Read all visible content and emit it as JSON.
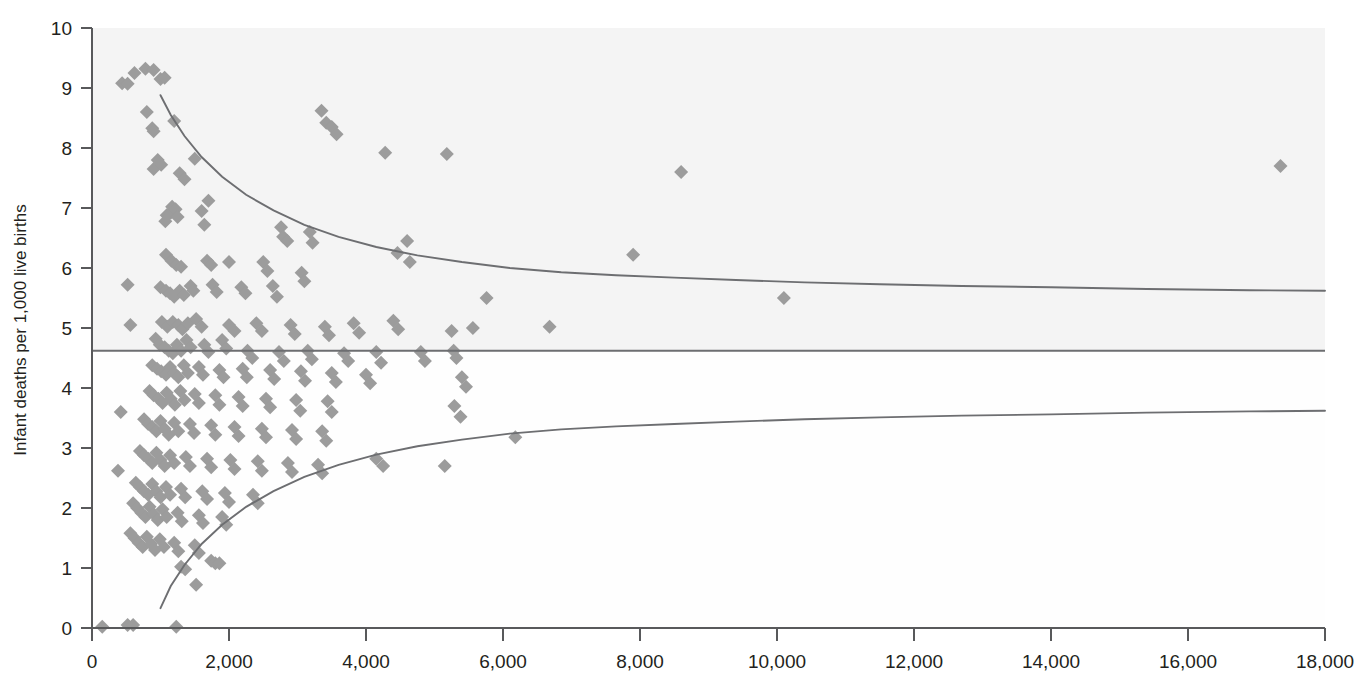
{
  "chart_data": {
    "type": "scatter",
    "title": "",
    "subtitle": "",
    "xlabel": "",
    "ylabel": "Infant deaths per 1,000 live births",
    "xlim": [
      0,
      18000
    ],
    "ylim": [
      0,
      10
    ],
    "grid": false,
    "legend": "none",
    "x_ticks": [
      0,
      2000,
      4000,
      6000,
      8000,
      10000,
      12000,
      14000,
      16000,
      18000
    ],
    "x_tick_labels": [
      "0",
      "2,000",
      "4,000",
      "6,000",
      "8,000",
      "10,000",
      "12,000",
      "14,000",
      "16,000",
      "18,000"
    ],
    "y_ticks": [
      0,
      1,
      2,
      3,
      4,
      5,
      6,
      7,
      8,
      9,
      10
    ],
    "y_tick_labels": [
      "0",
      "1",
      "2",
      "3",
      "4",
      "5",
      "6",
      "7",
      "8",
      "9",
      "10"
    ],
    "marker_shape": "diamond",
    "marker_color": "#9c9c9c",
    "marker_size": 11,
    "line_color": "#6d6e71",
    "center_line": {
      "label": "overall mean",
      "value": 4.62,
      "x_from": 0,
      "x_to": 18000
    },
    "control_limits": {
      "label": "95% control limits",
      "x_from": 1000,
      "x_to": 18000,
      "upper": [
        [
          1000,
          8.88
        ],
        [
          1150,
          8.55
        ],
        [
          1350,
          8.2
        ],
        [
          1600,
          7.85
        ],
        [
          1900,
          7.52
        ],
        [
          2250,
          7.22
        ],
        [
          2650,
          6.96
        ],
        [
          3100,
          6.72
        ],
        [
          3600,
          6.52
        ],
        [
          4150,
          6.35
        ],
        [
          4750,
          6.21
        ],
        [
          5400,
          6.1
        ],
        [
          6100,
          6.0
        ],
        [
          6850,
          5.93
        ],
        [
          7650,
          5.88
        ],
        [
          8500,
          5.84
        ],
        [
          9400,
          5.8
        ],
        [
          10400,
          5.76
        ],
        [
          11500,
          5.73
        ],
        [
          12700,
          5.7
        ],
        [
          14000,
          5.68
        ],
        [
          15400,
          5.65
        ],
        [
          16900,
          5.63
        ],
        [
          18000,
          5.62
        ]
      ],
      "lower": [
        [
          1000,
          0.33
        ],
        [
          1150,
          0.7
        ],
        [
          1350,
          1.05
        ],
        [
          1600,
          1.4
        ],
        [
          1900,
          1.72
        ],
        [
          2250,
          2.02
        ],
        [
          2650,
          2.28
        ],
        [
          3100,
          2.52
        ],
        [
          3600,
          2.72
        ],
        [
          4150,
          2.89
        ],
        [
          4750,
          3.03
        ],
        [
          5400,
          3.14
        ],
        [
          6100,
          3.24
        ],
        [
          6850,
          3.31
        ],
        [
          7650,
          3.36
        ],
        [
          8500,
          3.4
        ],
        [
          9400,
          3.44
        ],
        [
          10400,
          3.48
        ],
        [
          11500,
          3.51
        ],
        [
          12700,
          3.54
        ],
        [
          14000,
          3.56
        ],
        [
          15400,
          3.59
        ],
        [
          16900,
          3.61
        ],
        [
          18000,
          3.62
        ]
      ]
    },
    "points": [
      [
        150,
        0.02
      ],
      [
        520,
        0.05
      ],
      [
        600,
        0.05
      ],
      [
        1230,
        0.02
      ],
      [
        440,
        9.08
      ],
      [
        520,
        9.07
      ],
      [
        620,
        9.25
      ],
      [
        780,
        9.32
      ],
      [
        900,
        9.3
      ],
      [
        1000,
        9.15
      ],
      [
        1060,
        9.17
      ],
      [
        1200,
        8.45
      ],
      [
        800,
        8.6
      ],
      [
        880,
        8.33
      ],
      [
        900,
        8.28
      ],
      [
        3350,
        8.62
      ],
      [
        3420,
        8.42
      ],
      [
        3500,
        8.35
      ],
      [
        3570,
        8.23
      ],
      [
        4280,
        7.92
      ],
      [
        5180,
        7.9
      ],
      [
        8600,
        7.6
      ],
      [
        17350,
        7.7
      ],
      [
        900,
        7.65
      ],
      [
        960,
        7.8
      ],
      [
        1010,
        7.72
      ],
      [
        1500,
        7.82
      ],
      [
        1280,
        7.58
      ],
      [
        1350,
        7.48
      ],
      [
        1700,
        7.12
      ],
      [
        1170,
        7.02
      ],
      [
        1220,
        6.98
      ],
      [
        1150,
        6.92
      ],
      [
        1090,
        6.88
      ],
      [
        1250,
        6.85
      ],
      [
        1070,
        6.78
      ],
      [
        1600,
        6.95
      ],
      [
        1640,
        6.72
      ],
      [
        2760,
        6.68
      ],
      [
        2790,
        6.52
      ],
      [
        2850,
        6.45
      ],
      [
        3180,
        6.6
      ],
      [
        3220,
        6.42
      ],
      [
        4600,
        6.45
      ],
      [
        4640,
        6.1
      ],
      [
        4460,
        6.25
      ],
      [
        7900,
        6.22
      ],
      [
        1080,
        6.22
      ],
      [
        1160,
        6.12
      ],
      [
        1230,
        6.05
      ],
      [
        1300,
        6.02
      ],
      [
        1680,
        6.12
      ],
      [
        1740,
        6.05
      ],
      [
        2000,
        6.1
      ],
      [
        2500,
        6.1
      ],
      [
        2560,
        5.95
      ],
      [
        3060,
        5.92
      ],
      [
        3100,
        5.78
      ],
      [
        520,
        5.72
      ],
      [
        1000,
        5.68
      ],
      [
        1080,
        5.62
      ],
      [
        1140,
        5.58
      ],
      [
        1200,
        5.52
      ],
      [
        1280,
        5.62
      ],
      [
        1340,
        5.55
      ],
      [
        1440,
        5.7
      ],
      [
        1480,
        5.62
      ],
      [
        1760,
        5.72
      ],
      [
        1820,
        5.6
      ],
      [
        2180,
        5.68
      ],
      [
        2240,
        5.58
      ],
      [
        2640,
        5.7
      ],
      [
        2700,
        5.52
      ],
      [
        5760,
        5.5
      ],
      [
        10100,
        5.5
      ],
      [
        560,
        5.05
      ],
      [
        1020,
        5.1
      ],
      [
        1100,
        5.02
      ],
      [
        1180,
        5.1
      ],
      [
        1260,
        5.05
      ],
      [
        1320,
        4.98
      ],
      [
        1400,
        5.08
      ],
      [
        1520,
        5.15
      ],
      [
        1600,
        5.02
      ],
      [
        2000,
        5.05
      ],
      [
        2080,
        4.95
      ],
      [
        2400,
        5.08
      ],
      [
        2480,
        4.95
      ],
      [
        2900,
        5.05
      ],
      [
        2960,
        4.9
      ],
      [
        3400,
        5.02
      ],
      [
        3460,
        4.88
      ],
      [
        3820,
        5.08
      ],
      [
        3900,
        4.92
      ],
      [
        4400,
        5.12
      ],
      [
        4470,
        4.98
      ],
      [
        5560,
        5.0
      ],
      [
        6680,
        5.02
      ],
      [
        5250,
        4.95
      ],
      [
        5280,
        4.62
      ],
      [
        5320,
        4.5
      ],
      [
        930,
        4.82
      ],
      [
        990,
        4.72
      ],
      [
        1060,
        4.68
      ],
      [
        1120,
        4.62
      ],
      [
        1180,
        4.58
      ],
      [
        1240,
        4.72
      ],
      [
        1300,
        4.62
      ],
      [
        1380,
        4.8
      ],
      [
        1440,
        4.68
      ],
      [
        1640,
        4.72
      ],
      [
        1700,
        4.6
      ],
      [
        1900,
        4.8
      ],
      [
        1960,
        4.66
      ],
      [
        2270,
        4.62
      ],
      [
        2340,
        4.5
      ],
      [
        2730,
        4.6
      ],
      [
        2800,
        4.45
      ],
      [
        3150,
        4.62
      ],
      [
        3210,
        4.48
      ],
      [
        3680,
        4.58
      ],
      [
        3740,
        4.45
      ],
      [
        4150,
        4.6
      ],
      [
        4220,
        4.42
      ],
      [
        4800,
        4.6
      ],
      [
        4860,
        4.45
      ],
      [
        880,
        4.38
      ],
      [
        950,
        4.32
      ],
      [
        1010,
        4.28
      ],
      [
        1080,
        4.22
      ],
      [
        1140,
        4.35
      ],
      [
        1200,
        4.25
      ],
      [
        1260,
        4.18
      ],
      [
        1340,
        4.38
      ],
      [
        1400,
        4.25
      ],
      [
        1560,
        4.35
      ],
      [
        1620,
        4.22
      ],
      [
        1860,
        4.3
      ],
      [
        1920,
        4.18
      ],
      [
        2200,
        4.32
      ],
      [
        2260,
        4.18
      ],
      [
        2600,
        4.3
      ],
      [
        2660,
        4.15
      ],
      [
        3050,
        4.28
      ],
      [
        3110,
        4.12
      ],
      [
        3500,
        4.25
      ],
      [
        3560,
        4.1
      ],
      [
        4000,
        4.22
      ],
      [
        4060,
        4.08
      ],
      [
        5400,
        4.18
      ],
      [
        5460,
        4.02
      ],
      [
        840,
        3.95
      ],
      [
        900,
        3.88
      ],
      [
        970,
        3.82
      ],
      [
        1030,
        3.75
      ],
      [
        1090,
        3.92
      ],
      [
        1150,
        3.82
      ],
      [
        1210,
        3.72
      ],
      [
        1290,
        3.95
      ],
      [
        1350,
        3.8
      ],
      [
        1500,
        3.9
      ],
      [
        1560,
        3.75
      ],
      [
        1800,
        3.88
      ],
      [
        1860,
        3.72
      ],
      [
        2140,
        3.85
      ],
      [
        2200,
        3.7
      ],
      [
        2540,
        3.82
      ],
      [
        2600,
        3.68
      ],
      [
        2980,
        3.8
      ],
      [
        3040,
        3.62
      ],
      [
        3440,
        3.78
      ],
      [
        3500,
        3.6
      ],
      [
        5290,
        3.7
      ],
      [
        5380,
        3.52
      ],
      [
        420,
        3.6
      ],
      [
        760,
        3.48
      ],
      [
        820,
        3.4
      ],
      [
        880,
        3.35
      ],
      [
        940,
        3.28
      ],
      [
        1000,
        3.45
      ],
      [
        1060,
        3.32
      ],
      [
        1120,
        3.22
      ],
      [
        1200,
        3.42
      ],
      [
        1260,
        3.28
      ],
      [
        1430,
        3.4
      ],
      [
        1490,
        3.25
      ],
      [
        1740,
        3.38
      ],
      [
        1800,
        3.22
      ],
      [
        2080,
        3.35
      ],
      [
        2140,
        3.2
      ],
      [
        2480,
        3.32
      ],
      [
        2540,
        3.18
      ],
      [
        2920,
        3.3
      ],
      [
        2980,
        3.15
      ],
      [
        3360,
        3.28
      ],
      [
        3420,
        3.12
      ],
      [
        6180,
        3.18
      ],
      [
        700,
        2.95
      ],
      [
        760,
        2.88
      ],
      [
        820,
        2.82
      ],
      [
        880,
        2.75
      ],
      [
        940,
        2.92
      ],
      [
        1000,
        2.8
      ],
      [
        1060,
        2.7
      ],
      [
        1140,
        2.88
      ],
      [
        1200,
        2.75
      ],
      [
        1370,
        2.85
      ],
      [
        1430,
        2.7
      ],
      [
        1680,
        2.82
      ],
      [
        1740,
        2.68
      ],
      [
        2020,
        2.8
      ],
      [
        2080,
        2.65
      ],
      [
        2420,
        2.78
      ],
      [
        2480,
        2.62
      ],
      [
        2860,
        2.75
      ],
      [
        2920,
        2.6
      ],
      [
        3300,
        2.72
      ],
      [
        3360,
        2.58
      ],
      [
        4150,
        2.82
      ],
      [
        4250,
        2.7
      ],
      [
        5150,
        2.7
      ],
      [
        380,
        2.62
      ],
      [
        640,
        2.42
      ],
      [
        700,
        2.35
      ],
      [
        760,
        2.28
      ],
      [
        820,
        2.22
      ],
      [
        880,
        2.4
      ],
      [
        940,
        2.28
      ],
      [
        1000,
        2.18
      ],
      [
        1080,
        2.35
      ],
      [
        1140,
        2.22
      ],
      [
        1300,
        2.32
      ],
      [
        1360,
        2.18
      ],
      [
        1610,
        2.28
      ],
      [
        1680,
        2.15
      ],
      [
        1940,
        2.25
      ],
      [
        2000,
        2.1
      ],
      [
        2350,
        2.22
      ],
      [
        2420,
        2.08
      ],
      [
        600,
        2.08
      ],
      [
        660,
        2.0
      ],
      [
        720,
        1.92
      ],
      [
        780,
        1.85
      ],
      [
        840,
        2.02
      ],
      [
        900,
        1.9
      ],
      [
        960,
        1.8
      ],
      [
        1030,
        1.98
      ],
      [
        1090,
        1.85
      ],
      [
        1250,
        1.92
      ],
      [
        1310,
        1.78
      ],
      [
        1560,
        1.88
      ],
      [
        1620,
        1.75
      ],
      [
        1900,
        1.85
      ],
      [
        1960,
        1.72
      ],
      [
        560,
        1.58
      ],
      [
        620,
        1.5
      ],
      [
        680,
        1.42
      ],
      [
        740,
        1.35
      ],
      [
        800,
        1.52
      ],
      [
        860,
        1.4
      ],
      [
        920,
        1.3
      ],
      [
        990,
        1.48
      ],
      [
        1050,
        1.35
      ],
      [
        1200,
        1.42
      ],
      [
        1260,
        1.28
      ],
      [
        1500,
        1.38
      ],
      [
        1560,
        1.25
      ],
      [
        1740,
        1.12
      ],
      [
        1800,
        1.08
      ],
      [
        1860,
        1.08
      ],
      [
        1300,
        1.02
      ],
      [
        1360,
        0.98
      ],
      [
        1520,
        0.72
      ]
    ]
  },
  "axis": {
    "y_title": "Infant deaths per 1,000 live births"
  }
}
